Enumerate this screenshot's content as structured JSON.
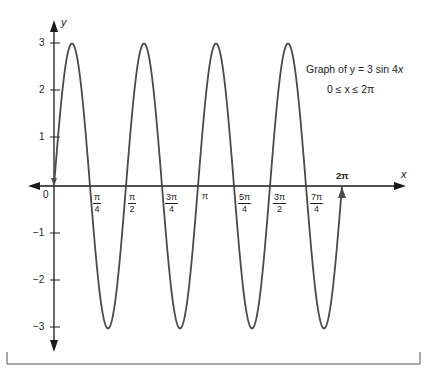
{
  "chart_data": {
    "type": "line",
    "title": "Graph of y = 3 sin 4x",
    "subtitle": "0 ≤ x ≤ 2π",
    "function": "y = 3 sin 4x",
    "domain": [
      0,
      6.2832
    ],
    "xlabel": "x",
    "ylabel": "y",
    "ylim": [
      -3,
      3
    ],
    "xlim": [
      0,
      6.2832
    ],
    "grid": false,
    "y_ticks": [
      "3",
      "2",
      "1",
      "-1",
      "-2",
      "-3"
    ],
    "y_tick_values": [
      3,
      2,
      1,
      -1,
      -2,
      -3
    ],
    "x_tick_labels": [
      "π/4",
      "π/2",
      "3π/4",
      "π",
      "5π/4",
      "3π/2",
      "7π/4",
      "2π"
    ],
    "x_tick_values": [
      0.7854,
      1.5708,
      2.3562,
      3.1416,
      3.927,
      4.7124,
      5.4978,
      6.2832
    ],
    "origin_label": "0",
    "series": [
      {
        "name": "y = 3 sin 4x",
        "x": [
          0,
          0.3927,
          0.7854,
          1.1781,
          1.5708,
          1.9635,
          2.3562,
          2.7489,
          3.1416,
          3.5343,
          3.927,
          4.3197,
          4.7124,
          5.1051,
          5.4978,
          5.8905,
          6.2832
        ],
        "values": [
          0,
          3,
          0,
          -3,
          0,
          3,
          0,
          -3,
          0,
          3,
          0,
          -3,
          0,
          3,
          0,
          -3,
          0
        ]
      }
    ],
    "annotations": [
      "Graph of y = 3 sin 4x",
      "0 ≤ x ≤ 2π"
    ]
  },
  "labels": {
    "y_axis": "y",
    "x_axis": "x",
    "origin": "0",
    "annotation_prefix": "Graph of ",
    "annotation_eq": "y = 3 sin 4",
    "annotation_var": "x",
    "domain_text": "0 ≤ x ≤ 2π",
    "y_ticks": {
      "p3": "3",
      "p2": "2",
      "p1": "1",
      "m1": "−1",
      "m2": "−2",
      "m3": "−3"
    },
    "x_ticks": {
      "pi4": {
        "num": "π",
        "den": "4"
      },
      "pi2": {
        "num": "π",
        "den": "2"
      },
      "pi34": {
        "num": "3π",
        "den": "4"
      },
      "pi": "π",
      "pi54": {
        "num": "5π",
        "den": "4"
      },
      "pi32": {
        "num": "3π",
        "den": "2"
      },
      "pi74": {
        "num": "7π",
        "den": "4"
      },
      "pi2full": "2π"
    }
  },
  "colors": {
    "curve": "#4a4a4a",
    "axis": "#1a1a1a"
  }
}
